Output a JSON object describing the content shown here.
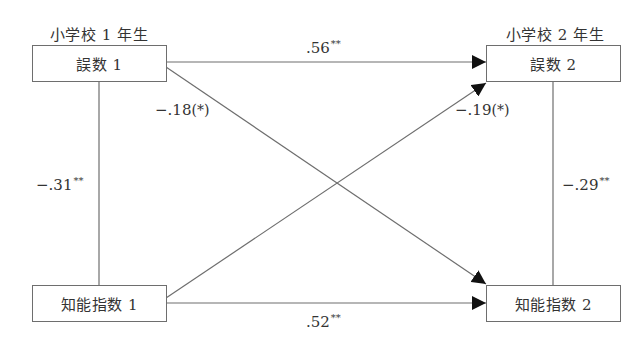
{
  "diagram": {
    "type": "cross-lagged-panel",
    "time_labels": {
      "t1": "小学校 1 年生",
      "t2": "小学校 2 年生"
    },
    "nodes": {
      "errors_t1": "誤数 1",
      "errors_t2": "誤数 2",
      "iq_t1": "知能指数 1",
      "iq_t2": "知能指数 2"
    },
    "paths": {
      "errors_t1_to_errors_t2": {
        "value": ".56",
        "sig": "**"
      },
      "iq_t1_to_iq_t2": {
        "value": ".52",
        "sig": "**"
      },
      "errors_t1_to_iq_t2": {
        "value": "−.18",
        "sig": "(*)"
      },
      "iq_t1_to_errors_t2": {
        "value": "−.19",
        "sig": "(*)"
      },
      "errors_t1_iq_t1_corr": {
        "value": "−.31",
        "sig": "**"
      },
      "errors_t2_iq_t2_corr": {
        "value": "−.29",
        "sig": "**"
      }
    },
    "colors": {
      "line": "#6e6e6e",
      "arrowhead": "#111111",
      "text": "#333333"
    }
  }
}
